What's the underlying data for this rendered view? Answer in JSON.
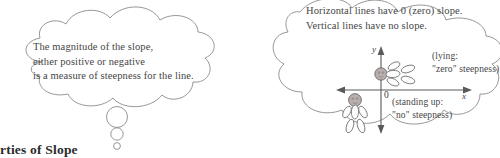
{
  "page": {
    "background_color": "#ffffff",
    "ink_color": "#454545",
    "outline_color": "#8a8a8a"
  },
  "left_cloud": {
    "name": "thought-cloud-magnitude",
    "lines": [
      "The magnitude of the slope,",
      "either positive or negative",
      "is a measure of steepness for the line."
    ],
    "line1": "The magnitude of the slope,",
    "line2": "either positive or negative",
    "line3": "is a measure of steepness for the line.",
    "tail_bubbles": 3
  },
  "right_cloud": {
    "name": "thought-cloud-horizontal-vertical",
    "line1": "Horizontal lines have 0 (zero) slope.",
    "line2": "Vertical lines have no slope.",
    "diagram": {
      "x_axis_label": "x",
      "y_axis_label": "y",
      "origin_label": "0",
      "lying_caption_line1": "(lying:",
      "lying_caption_line2": "\"zero\" steepness)",
      "standing_caption_line1": "(standing up:",
      "standing_caption_line2": "\"no\" steepness)",
      "figures": [
        {
          "name": "lying-stick-figure",
          "orientation": "horizontal"
        },
        {
          "name": "standing-stick-figure",
          "orientation": "vertical"
        }
      ]
    }
  },
  "section_heading": {
    "text": "rties of Slope"
  }
}
